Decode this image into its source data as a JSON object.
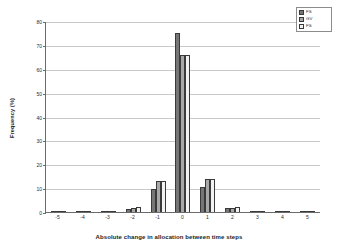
{
  "chart_data": {
    "type": "bar",
    "title": "",
    "xlabel": "Absolute change in allocation between time steps",
    "ylabel": "Frequency (%)",
    "categories": [
      "-5",
      "-4",
      "-3",
      "-2",
      "-1",
      "0",
      "1",
      "2",
      "3",
      "4",
      "5"
    ],
    "series": [
      {
        "name": "FS",
        "color": "#767676",
        "values": [
          0.2,
          0.3,
          0.4,
          1.4,
          9.8,
          74.8,
          10.5,
          1.6,
          0.5,
          0.2,
          0.1
        ]
      },
      {
        "name": "GV",
        "color": "#a8a8a8",
        "values": [
          0.2,
          0.4,
          0.5,
          1.8,
          12.8,
          65.8,
          13.8,
          1.8,
          0.5,
          0.2,
          0.1
        ]
      },
      {
        "name": "FS",
        "color": "#f2f2f2",
        "values": [
          0.2,
          0.4,
          0.6,
          1.9,
          12.9,
          65.7,
          14.0,
          1.9,
          0.5,
          0.2,
          0.1
        ]
      }
    ],
    "ylim": [
      0,
      80
    ],
    "yticks": [
      0,
      10,
      20,
      30,
      40,
      50,
      60,
      70,
      80
    ],
    "grid": true,
    "legend_position": "top-right"
  },
  "legend": {
    "entries": [
      {
        "label": "FS"
      },
      {
        "label": "GV"
      },
      {
        "label": "FS"
      }
    ]
  }
}
